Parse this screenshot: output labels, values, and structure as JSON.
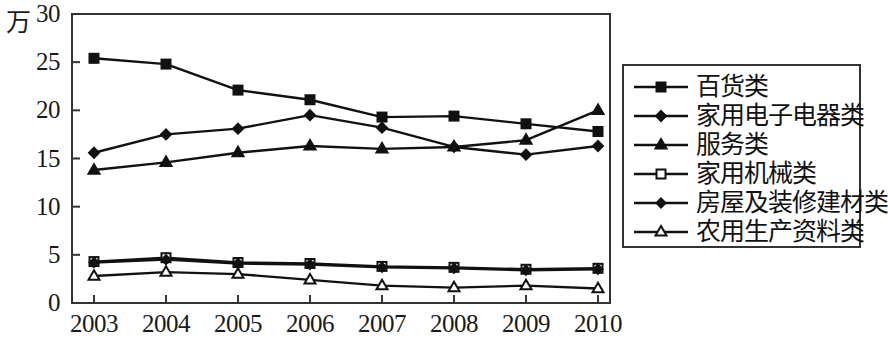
{
  "chart_data": {
    "type": "line",
    "title": "",
    "subtitle": "",
    "xlabel": "",
    "ylabel": "",
    "unit_label": "万",
    "categories": [
      "2003",
      "2004",
      "2005",
      "2006",
      "2007",
      "2008",
      "2009",
      "2010"
    ],
    "x": [
      2003,
      2004,
      2005,
      2006,
      2007,
      2008,
      2009,
      2010
    ],
    "ylim": [
      0,
      30
    ],
    "yticks": [
      0,
      5,
      10,
      15,
      20,
      25,
      30
    ],
    "ytick_labels": [
      "0",
      "5",
      "10",
      "15",
      "20",
      "25",
      "30"
    ],
    "grid": false,
    "legend_position": "right",
    "series": [
      {
        "name": "百货类",
        "marker": "filled-square",
        "values": [
          25.4,
          24.8,
          22.1,
          21.1,
          19.3,
          19.4,
          18.6,
          17.8
        ]
      },
      {
        "name": "家用电子电器类",
        "marker": "filled-diamond",
        "values": [
          15.6,
          17.5,
          18.1,
          19.5,
          18.2,
          16.2,
          15.4,
          16.3
        ]
      },
      {
        "name": "服务类",
        "marker": "filled-triangle",
        "values": [
          13.8,
          14.6,
          15.6,
          16.3,
          16.0,
          16.2,
          16.9,
          20.0
        ]
      },
      {
        "name": "家用机械类",
        "marker": "open-square",
        "values": [
          4.3,
          4.7,
          4.2,
          4.1,
          3.8,
          3.7,
          3.5,
          3.6
        ]
      },
      {
        "name": "房屋及装修建材类",
        "marker": "filled-diamond-small",
        "values": [
          4.2,
          4.5,
          4.1,
          4.0,
          3.7,
          3.6,
          3.4,
          3.5
        ]
      },
      {
        "name": "农用生产资料类",
        "marker": "open-triangle",
        "values": [
          2.8,
          3.2,
          3.0,
          2.4,
          1.8,
          1.6,
          1.8,
          1.5
        ]
      }
    ],
    "colors": {
      "line": "#111111",
      "marker_fill": "#111111",
      "marker_open_fill": "#ffffff",
      "axis": "#333333",
      "background": "#ffffff"
    }
  }
}
